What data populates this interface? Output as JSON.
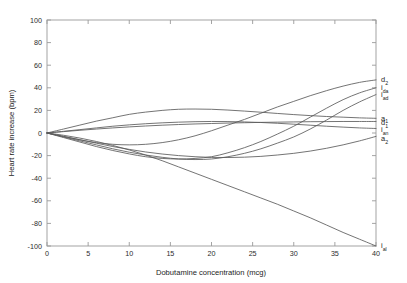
{
  "chart_data": {
    "type": "line",
    "title": "",
    "xlabel": "Dobutamine concentration (mcg)",
    "ylabel": "Heart rate increase (bpm)",
    "xlim": [
      0,
      40
    ],
    "ylim": [
      -100,
      100
    ],
    "xticks": [
      0,
      5,
      10,
      15,
      20,
      25,
      30,
      35,
      40
    ],
    "xtick_labels": [
      "0",
      "5",
      "10",
      "15",
      "20",
      "25",
      "30",
      "35",
      "40"
    ],
    "yticks": [
      -100,
      -80,
      -60,
      -40,
      -20,
      0,
      20,
      40,
      60,
      80,
      100
    ],
    "ytick_labels": [
      "-100",
      "-80",
      "-60",
      "-40",
      "-20",
      "0",
      "20",
      "40",
      "60",
      "80",
      "100"
    ],
    "grid": false,
    "legend_position": "right-of-axes-endpoint-labels",
    "line_color": "#5b5b5b",
    "axis_color": "#9a9a9a",
    "x": [
      0,
      2,
      4,
      6,
      8,
      10,
      12,
      14,
      16,
      18,
      20,
      22,
      24,
      26,
      28,
      30,
      32,
      34,
      36,
      38,
      40
    ],
    "series": [
      {
        "name": "d_2",
        "label_main": "d",
        "label_sub": "2",
        "label_y": 47,
        "values": [
          0,
          -3,
          -6,
          -8.5,
          -10,
          -10.5,
          -10,
          -8.5,
          -6,
          -2.5,
          2,
          7,
          12,
          17.5,
          23,
          28,
          33,
          37.5,
          41.5,
          44.8,
          47
        ]
      },
      {
        "name": "i_da",
        "label_main": "i",
        "label_sub": "da",
        "label_y": 40,
        "values": [
          0,
          -4,
          -8,
          -12,
          -15.5,
          -18.5,
          -21,
          -22.5,
          -23,
          -22.5,
          -21,
          -17.5,
          -13,
          -7.5,
          -1,
          6,
          14,
          22,
          29.5,
          35.5,
          40
        ]
      },
      {
        "name": "i_ad",
        "label_main": "i",
        "label_sub": "ad",
        "label_y": 34,
        "values": [
          0,
          -3.5,
          -7,
          -10.5,
          -14,
          -17,
          -19.5,
          -21.5,
          -23,
          -23.5,
          -23,
          -21,
          -18,
          -14,
          -9,
          -3.5,
          3.5,
          11.5,
          20,
          27.5,
          34
        ]
      },
      {
        "name": "a_1",
        "label_main": "a",
        "label_sub": "1",
        "label_y": 13,
        "values": [
          0,
          3.5,
          7,
          10.5,
          13.5,
          16.5,
          18.5,
          20,
          21,
          21.2,
          21,
          20.3,
          19.4,
          18.4,
          17.3,
          16.3,
          15.4,
          14.6,
          14,
          13.4,
          13
        ]
      },
      {
        "name": "d_1",
        "label_main": "d",
        "label_sub": "1",
        "label_y": 9,
        "values": [
          0,
          1.2,
          2.4,
          3.5,
          4.5,
          5.4,
          6.2,
          6.9,
          7.5,
          8,
          8.4,
          8.8,
          9.1,
          9.4,
          9.6,
          9.8,
          10,
          10.1,
          10.2,
          10.2,
          10.2
        ]
      },
      {
        "name": "i_an",
        "label_main": "i",
        "label_sub": "an",
        "label_y": 3,
        "values": [
          0,
          1.5,
          3,
          4.5,
          6,
          7.2,
          8.2,
          9,
          9.6,
          10,
          10.2,
          10.1,
          9.8,
          9.3,
          8.6,
          7.8,
          6.9,
          6,
          5.2,
          4.5,
          4
        ]
      },
      {
        "name": "a_2",
        "label_main": "a",
        "label_sub": "2",
        "label_y": -5,
        "values": [
          0,
          -3,
          -6,
          -9,
          -12,
          -14.5,
          -16.8,
          -18.6,
          -20,
          -21,
          -21.6,
          -21.7,
          -21.4,
          -20.7,
          -19.5,
          -18,
          -16,
          -13.5,
          -10.5,
          -7,
          -3
        ]
      },
      {
        "name": "i_al",
        "label_main": "i",
        "label_sub": "al",
        "label_y": -100,
        "values": [
          0,
          -2,
          -4.5,
          -7.5,
          -11,
          -15,
          -19.5,
          -24.5,
          -30,
          -35.5,
          -41,
          -46.5,
          -52,
          -57.5,
          -63,
          -69,
          -75,
          -81.5,
          -88,
          -94,
          -100
        ]
      }
    ]
  }
}
